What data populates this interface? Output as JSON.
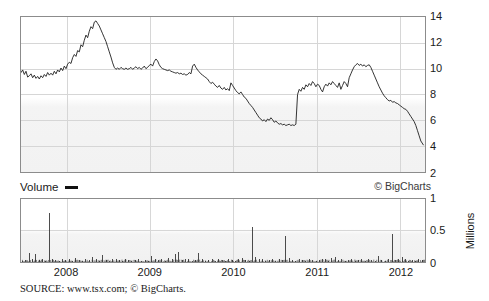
{
  "legend": {
    "volume_label": "Volume",
    "swatch_name": "volume-line-swatch"
  },
  "credit": "© BigCharts",
  "millions_axis_title": "Millions",
  "source": "SOURCE: www.tsx.com; © BigCharts.",
  "colors": {
    "line": "#1c1c1c",
    "grid": "#d6d6d6",
    "frame": "#8c8c8c",
    "background": "#ffffff",
    "panel_gradient_bottom": "#f1f1f1"
  },
  "chart_data": [
    {
      "id": "price",
      "type": "line",
      "title": "",
      "xlabel": "",
      "ylabel": "",
      "ylim": [
        2,
        14
      ],
      "yticks": [
        2,
        4,
        6,
        8,
        10,
        12,
        14
      ],
      "ytick_labels": [
        "2",
        "4",
        "6",
        "8",
        "10",
        "12",
        "14"
      ],
      "xlim": [
        2007.45,
        2012.3
      ],
      "xticks": [
        2008,
        2009,
        2010,
        2011,
        2012
      ],
      "xtick_labels": [
        "2008",
        "2009",
        "2010",
        "2011",
        "2012"
      ],
      "grid": true,
      "legend_position": "none",
      "series": [
        {
          "name": "Share price (CAD)",
          "x": [
            2007.45,
            2007.47,
            2007.49,
            2007.51,
            2007.53,
            2007.55,
            2007.57,
            2007.59,
            2007.61,
            2007.63,
            2007.65,
            2007.67,
            2007.69,
            2007.71,
            2007.73,
            2007.75,
            2007.77,
            2007.79,
            2007.81,
            2007.83,
            2007.85,
            2007.87,
            2007.89,
            2007.91,
            2007.93,
            2007.95,
            2007.97,
            2007.99,
            2008.01,
            2008.03,
            2008.05,
            2008.07,
            2008.09,
            2008.11,
            2008.13,
            2008.15,
            2008.17,
            2008.19,
            2008.21,
            2008.23,
            2008.25,
            2008.27,
            2008.29,
            2008.31,
            2008.33,
            2008.35,
            2008.37,
            2008.39,
            2008.41,
            2008.43,
            2008.45,
            2008.47,
            2008.49,
            2008.51,
            2008.53,
            2008.55,
            2008.57,
            2008.59,
            2008.61,
            2008.63,
            2008.65,
            2008.67,
            2008.69,
            2008.71,
            2008.73,
            2008.75,
            2008.77,
            2008.79,
            2008.81,
            2008.83,
            2008.85,
            2008.87,
            2008.89,
            2008.91,
            2008.93,
            2008.95,
            2008.97,
            2008.99,
            2009.01,
            2009.03,
            2009.05,
            2009.07,
            2009.09,
            2009.11,
            2009.13,
            2009.15,
            2009.17,
            2009.19,
            2009.21,
            2009.23,
            2009.25,
            2009.27,
            2009.29,
            2009.31,
            2009.33,
            2009.35,
            2009.37,
            2009.39,
            2009.41,
            2009.43,
            2009.45,
            2009.47,
            2009.49,
            2009.51,
            2009.53,
            2009.55,
            2009.57,
            2009.59,
            2009.61,
            2009.63,
            2009.65,
            2009.67,
            2009.69,
            2009.71,
            2009.73,
            2009.75,
            2009.77,
            2009.79,
            2009.81,
            2009.83,
            2009.85,
            2009.87,
            2009.89,
            2009.91,
            2009.93,
            2009.95,
            2009.97,
            2009.99,
            2010.01,
            2010.03,
            2010.05,
            2010.07,
            2010.09,
            2010.11,
            2010.13,
            2010.15,
            2010.17,
            2010.19,
            2010.21,
            2010.23,
            2010.25,
            2010.27,
            2010.29,
            2010.31,
            2010.33,
            2010.35,
            2010.37,
            2010.39,
            2010.41,
            2010.43,
            2010.45,
            2010.47,
            2010.49,
            2010.51,
            2010.53,
            2010.55,
            2010.57,
            2010.59,
            2010.61,
            2010.63,
            2010.65,
            2010.67,
            2010.69,
            2010.71,
            2010.73,
            2010.75,
            2010.77,
            2010.79,
            2010.81,
            2010.83,
            2010.85,
            2010.87,
            2010.89,
            2010.91,
            2010.93,
            2010.95,
            2010.97,
            2010.99,
            2011.01,
            2011.03,
            2011.05,
            2011.07,
            2011.09,
            2011.11,
            2011.13,
            2011.15,
            2011.17,
            2011.19,
            2011.21,
            2011.23,
            2011.25,
            2011.27,
            2011.29,
            2011.31,
            2011.33,
            2011.35,
            2011.37,
            2011.39,
            2011.41,
            2011.43,
            2011.45,
            2011.47,
            2011.49,
            2011.51,
            2011.53,
            2011.55,
            2011.57,
            2011.59,
            2011.61,
            2011.63,
            2011.65,
            2011.67,
            2011.69,
            2011.71,
            2011.73,
            2011.75,
            2011.77,
            2011.79,
            2011.81,
            2011.83,
            2011.85,
            2011.87,
            2011.89,
            2011.91,
            2011.93,
            2011.95,
            2011.97,
            2011.99,
            2012.01,
            2012.03,
            2012.05,
            2012.07,
            2012.09,
            2012.11,
            2012.13,
            2012.15,
            2012.17,
            2012.19,
            2012.21,
            2012.23,
            2012.25,
            2012.28
          ],
          "y": [
            9.7,
            9.9,
            9.55,
            9.8,
            9.35,
            9.45,
            9.6,
            9.3,
            9.5,
            9.25,
            9.4,
            9.2,
            9.45,
            9.3,
            9.55,
            9.4,
            9.7,
            9.5,
            9.65,
            9.5,
            9.8,
            9.6,
            9.9,
            9.75,
            10.05,
            9.85,
            10.2,
            10.0,
            10.35,
            10.5,
            10.4,
            10.85,
            11.1,
            10.95,
            11.4,
            11.3,
            11.85,
            11.7,
            12.2,
            12.6,
            12.4,
            12.9,
            13.25,
            13.1,
            13.6,
            13.7,
            13.5,
            13.3,
            13.0,
            12.7,
            12.4,
            12.1,
            11.7,
            11.3,
            10.9,
            10.45,
            10.1,
            9.95,
            10.05,
            9.95,
            10.1,
            10.0,
            9.95,
            10.05,
            9.95,
            10.0,
            10.1,
            9.95,
            10.05,
            10.15,
            10.0,
            10.1,
            9.95,
            10.05,
            10.2,
            10.0,
            10.1,
            10.25,
            10.35,
            10.2,
            10.55,
            10.75,
            10.6,
            10.3,
            10.1,
            10.0,
            9.95,
            9.9,
            9.85,
            9.9,
            9.8,
            9.75,
            9.7,
            9.65,
            9.7,
            9.6,
            9.65,
            9.55,
            9.6,
            9.5,
            9.55,
            9.7,
            9.6,
            10.2,
            10.35,
            10.1,
            9.9,
            9.75,
            9.6,
            9.5,
            9.4,
            9.3,
            9.2,
            9.0,
            8.85,
            8.95,
            8.8,
            8.65,
            8.55,
            8.7,
            8.5,
            8.4,
            8.55,
            8.35,
            8.45,
            8.3,
            8.9,
            8.7,
            8.5,
            8.3,
            8.15,
            8.05,
            8.2,
            8.0,
            7.8,
            7.7,
            7.5,
            7.3,
            7.15,
            7.0,
            6.8,
            6.6,
            6.4,
            6.2,
            6.1,
            5.95,
            6.05,
            5.9,
            6.1,
            6.0,
            6.2,
            6.05,
            5.85,
            5.95,
            5.8,
            5.7,
            5.75,
            5.65,
            5.7,
            5.6,
            5.65,
            5.7,
            5.6,
            5.65,
            5.6,
            5.7,
            8.0,
            8.4,
            8.25,
            8.55,
            8.4,
            8.75,
            8.6,
            8.85,
            8.7,
            9.0,
            8.85,
            8.6,
            8.8,
            8.7,
            8.4,
            8.2,
            8.6,
            8.8,
            8.65,
            8.9,
            8.75,
            9.0,
            8.85,
            8.7,
            8.55,
            8.9,
            8.4,
            8.7,
            9.0,
            8.85,
            8.6,
            9.3,
            9.6,
            9.9,
            10.15,
            10.3,
            10.4,
            10.25,
            10.35,
            10.2,
            10.3,
            10.15,
            10.25,
            10.3,
            10.1,
            9.8,
            9.5,
            9.2,
            8.9,
            8.6,
            8.35,
            8.1,
            7.9,
            7.75,
            7.6,
            7.5,
            7.55,
            7.4,
            7.45,
            7.35,
            7.3,
            7.2,
            7.1,
            7.0,
            6.9,
            6.85,
            6.7,
            6.5,
            6.3,
            6.1,
            5.9,
            5.6,
            5.2,
            4.8,
            4.4,
            4.1,
            3.9,
            4.0,
            3.8,
            3.6,
            3.5,
            3.35,
            3.2,
            3.0,
            2.8,
            2.6,
            2.5,
            2.55,
            2.7,
            2.9,
            3.2,
            3.4,
            3.55,
            3.4,
            3.2,
            3.0,
            2.85,
            2.75,
            2.6,
            2.55,
            2.6,
            2.5
          ]
        }
      ]
    },
    {
      "id": "volume",
      "type": "bar",
      "title": "Volume",
      "xlabel": "",
      "ylabel": "Millions",
      "ylim": [
        0,
        1
      ],
      "yticks": [
        0,
        0.5,
        1
      ],
      "ytick_labels": [
        "0",
        "0.5",
        "1"
      ],
      "xlim": [
        2007.45,
        2012.3
      ],
      "xticks": [
        2008,
        2009,
        2010,
        2011,
        2012
      ],
      "xtick_labels": [
        "2008",
        "2009",
        "2010",
        "2011",
        "2012"
      ],
      "grid": true,
      "legend_position": "top-left",
      "series": [
        {
          "name": "Volume (millions of shares)",
          "x": [
            2007.46,
            2007.5,
            2007.54,
            2007.58,
            2007.62,
            2007.66,
            2007.7,
            2007.74,
            2007.78,
            2007.82,
            2007.86,
            2007.9,
            2007.94,
            2007.98,
            2008.02,
            2008.06,
            2008.1,
            2008.14,
            2008.18,
            2008.22,
            2008.26,
            2008.3,
            2008.34,
            2008.38,
            2008.42,
            2008.46,
            2008.5,
            2008.54,
            2008.58,
            2008.62,
            2008.66,
            2008.7,
            2008.74,
            2008.78,
            2008.82,
            2008.86,
            2008.9,
            2008.94,
            2008.98,
            2009.02,
            2009.06,
            2009.1,
            2009.14,
            2009.18,
            2009.22,
            2009.26,
            2009.3,
            2009.34,
            2009.38,
            2009.42,
            2009.46,
            2009.5,
            2009.54,
            2009.58,
            2009.62,
            2009.66,
            2009.7,
            2009.74,
            2009.78,
            2009.82,
            2009.86,
            2009.9,
            2009.94,
            2009.98,
            2010.02,
            2010.06,
            2010.1,
            2010.14,
            2010.18,
            2010.22,
            2010.26,
            2010.3,
            2010.34,
            2010.38,
            2010.42,
            2010.46,
            2010.5,
            2010.54,
            2010.58,
            2010.62,
            2010.66,
            2010.7,
            2010.74,
            2010.78,
            2010.82,
            2010.86,
            2010.9,
            2010.94,
            2010.98,
            2011.02,
            2011.06,
            2011.1,
            2011.14,
            2011.18,
            2011.22,
            2011.26,
            2011.3,
            2011.34,
            2011.38,
            2011.42,
            2011.46,
            2011.5,
            2011.54,
            2011.58,
            2011.62,
            2011.66,
            2011.7,
            2011.74,
            2011.78,
            2011.82,
            2011.86,
            2011.9,
            2011.94,
            2011.98,
            2012.02,
            2012.06,
            2012.1,
            2012.14,
            2012.18,
            2012.22,
            2012.26
          ],
          "y": [
            0.02,
            0.03,
            0.15,
            0.04,
            0.12,
            0.03,
            0.05,
            0.02,
            0.78,
            0.04,
            0.03,
            0.02,
            0.05,
            0.03,
            0.04,
            0.02,
            0.06,
            0.03,
            0.02,
            0.04,
            0.03,
            0.08,
            0.04,
            0.02,
            0.11,
            0.03,
            0.02,
            0.04,
            0.05,
            0.03,
            0.02,
            0.04,
            0.03,
            0.02,
            0.03,
            0.04,
            0.02,
            0.03,
            0.02,
            0.09,
            0.04,
            0.03,
            0.05,
            0.02,
            0.07,
            0.04,
            0.12,
            0.16,
            0.03,
            0.05,
            0.04,
            0.02,
            0.03,
            0.14,
            0.04,
            0.02,
            0.03,
            0.05,
            0.02,
            0.04,
            0.03,
            0.02,
            0.05,
            0.03,
            0.02,
            0.04,
            0.06,
            0.03,
            0.02,
            0.55,
            0.08,
            0.05,
            0.04,
            0.02,
            0.03,
            0.05,
            0.02,
            0.04,
            0.03,
            0.42,
            0.07,
            0.03,
            0.02,
            0.05,
            0.03,
            0.02,
            0.04,
            0.03,
            0.02,
            0.03,
            0.05,
            0.04,
            0.02,
            0.06,
            0.08,
            0.03,
            0.05,
            0.02,
            0.03,
            0.04,
            0.02,
            0.03,
            0.05,
            0.02,
            0.04,
            0.03,
            0.02,
            0.09,
            0.03,
            0.02,
            0.04,
            0.45,
            0.03,
            0.05,
            0.08,
            0.04,
            0.02,
            0.03,
            0.02,
            0.04,
            0.03
          ]
        }
      ]
    }
  ]
}
